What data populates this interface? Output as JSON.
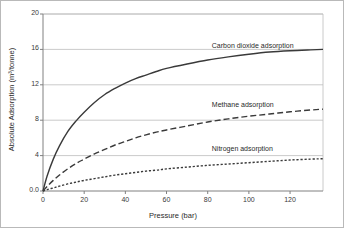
{
  "figure": {
    "background_color": "#ffffff",
    "frame_color": "#b9b9b9",
    "grid_color": "#bdbdbd",
    "axis_color": "#808080",
    "curve_color": "#3a3a3a"
  },
  "chart_data": {
    "type": "line",
    "title": "",
    "xlabel": "Pressure (bar)",
    "ylabel": "Absolute Adsorption (m³/tonne)",
    "xlim": [
      0,
      136
    ],
    "ylim": [
      0,
      20
    ],
    "grid": true,
    "legend_position": "inline-right-of-curve",
    "xticks": [
      "0",
      "20",
      "40",
      "60",
      "80",
      "100",
      "120"
    ],
    "xtick_values": [
      0,
      20,
      40,
      60,
      80,
      100,
      120
    ],
    "yticks": [
      "0.0",
      "4",
      "8",
      "12",
      "16",
      "20"
    ],
    "ytick_values": [
      0,
      4,
      8,
      12,
      16,
      20
    ],
    "x": [
      0,
      2,
      5,
      8,
      12,
      16,
      20,
      25,
      30,
      35,
      40,
      45,
      50,
      55,
      60,
      70,
      80,
      90,
      100,
      110,
      120,
      130,
      136
    ],
    "series": [
      {
        "name": "Carbon dioxide adsorption",
        "label": "Carbon dioxide adsorption",
        "style": "solid",
        "color": "#3a3a3a",
        "values": [
          0.0,
          1.7,
          3.6,
          5.1,
          6.7,
          7.9,
          8.9,
          10.0,
          10.9,
          11.6,
          12.2,
          12.7,
          13.1,
          13.5,
          13.85,
          14.35,
          14.8,
          15.15,
          15.45,
          15.7,
          15.85,
          15.95,
          16.0
        ],
        "label_x": 82,
        "label_y": 16.3
      },
      {
        "name": "Methane adsorption",
        "label": "Methane adsorption",
        "style": "dashed",
        "color": "#3a3a3a",
        "values": [
          0.0,
          0.5,
          1.2,
          1.8,
          2.5,
          3.1,
          3.6,
          4.2,
          4.7,
          5.2,
          5.6,
          6.0,
          6.35,
          6.65,
          6.9,
          7.35,
          7.8,
          8.15,
          8.45,
          8.7,
          8.95,
          9.15,
          9.25
        ],
        "label_x": 82,
        "label_y": 9.6
      },
      {
        "name": "Nitrogen adsorption",
        "label": "Nitrogen adsorption",
        "style": "dotted",
        "color": "#3a3a3a",
        "values": [
          0.0,
          0.15,
          0.35,
          0.55,
          0.8,
          1.0,
          1.2,
          1.4,
          1.6,
          1.8,
          1.95,
          2.1,
          2.25,
          2.35,
          2.5,
          2.7,
          2.9,
          3.05,
          3.2,
          3.35,
          3.5,
          3.6,
          3.65
        ],
        "label_x": 82,
        "label_y": 4.6
      }
    ]
  }
}
